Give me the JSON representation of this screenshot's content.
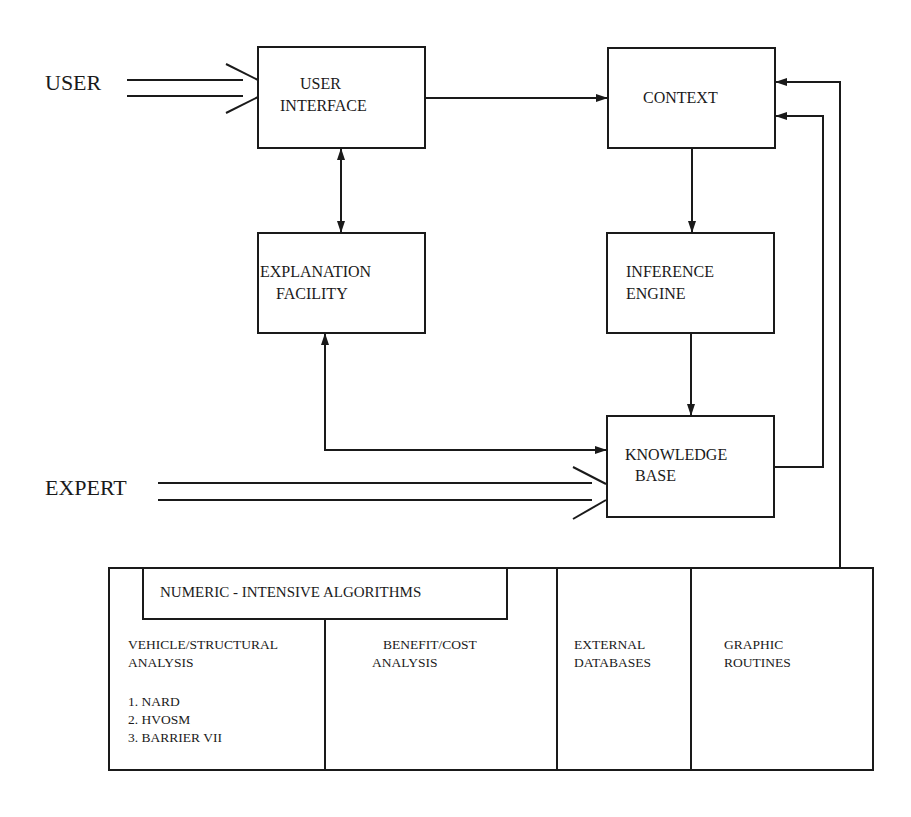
{
  "diagram": {
    "type": "expert-system-architecture",
    "actors": {
      "user": "USER",
      "expert": "EXPERT"
    },
    "boxes": {
      "user_interface": {
        "line1": "USER",
        "line2": "INTERFACE"
      },
      "context": {
        "line1": "CONTEXT"
      },
      "explanation_facility": {
        "line1": "EXPLANATION",
        "line2": "FACILITY"
      },
      "inference_engine": {
        "line1": "INFERENCE",
        "line2": "ENGINE"
      },
      "knowledge_base": {
        "line1": "KNOWLEDGE",
        "line2": "BASE"
      }
    },
    "bottom_panel": {
      "header": "NUMERIC - INTENSIVE ALGORITHMS",
      "sections": [
        {
          "line1": "VEHICLE/STRUCTURAL",
          "line2": "ANALYSIS",
          "items": [
            "1. NARD",
            "2. HVOSM",
            "3. BARRIER VII"
          ]
        },
        {
          "line1": "BENEFIT/COST",
          "line2": "ANALYSIS"
        },
        {
          "line1": "EXTERNAL",
          "line2": "DATABASES"
        },
        {
          "line1": "GRAPHIC",
          "line2": "ROUTINES"
        }
      ]
    },
    "connections": [
      {
        "from": "USER",
        "to": "USER INTERFACE",
        "style": "double-line"
      },
      {
        "from": "USER INTERFACE",
        "to": "CONTEXT",
        "style": "arrow"
      },
      {
        "from": "USER INTERFACE",
        "to": "EXPLANATION FACILITY",
        "style": "bidirectional-arrow"
      },
      {
        "from": "CONTEXT",
        "to": "INFERENCE ENGINE",
        "style": "arrow"
      },
      {
        "from": "INFERENCE ENGINE",
        "to": "KNOWLEDGE BASE",
        "style": "arrow"
      },
      {
        "from": "EXPLANATION FACILITY",
        "to": "KNOWLEDGE BASE",
        "style": "bidirectional-arrow"
      },
      {
        "from": "EXPERT",
        "to": "KNOWLEDGE BASE",
        "style": "double-line"
      },
      {
        "from": "KNOWLEDGE BASE",
        "to": "CONTEXT",
        "style": "arrow"
      },
      {
        "from": "NUMERIC - INTENSIVE ALGORITHMS panel",
        "to": "CONTEXT",
        "style": "arrow"
      }
    ],
    "colors": {
      "stroke": "#1a1a1a",
      "background": "#ffffff"
    }
  }
}
